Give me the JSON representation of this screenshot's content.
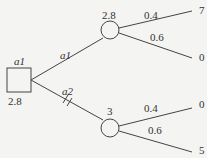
{
  "decision_node": {
    "label": "a1",
    "value": "2.8"
  },
  "branches": [
    {
      "label": "a1",
      "blocked": false
    },
    {
      "label": "a2",
      "blocked": true
    }
  ],
  "chance_nodes": [
    {
      "value": "2.8",
      "outcomes": [
        {
          "prob": "0.4",
          "payoff": "7"
        },
        {
          "prob": "0.6",
          "payoff": "0"
        }
      ]
    },
    {
      "value": "3",
      "outcomes": [
        {
          "prob": "0.4",
          "payoff": "0"
        },
        {
          "prob": "0.6",
          "payoff": "5"
        }
      ]
    }
  ]
}
